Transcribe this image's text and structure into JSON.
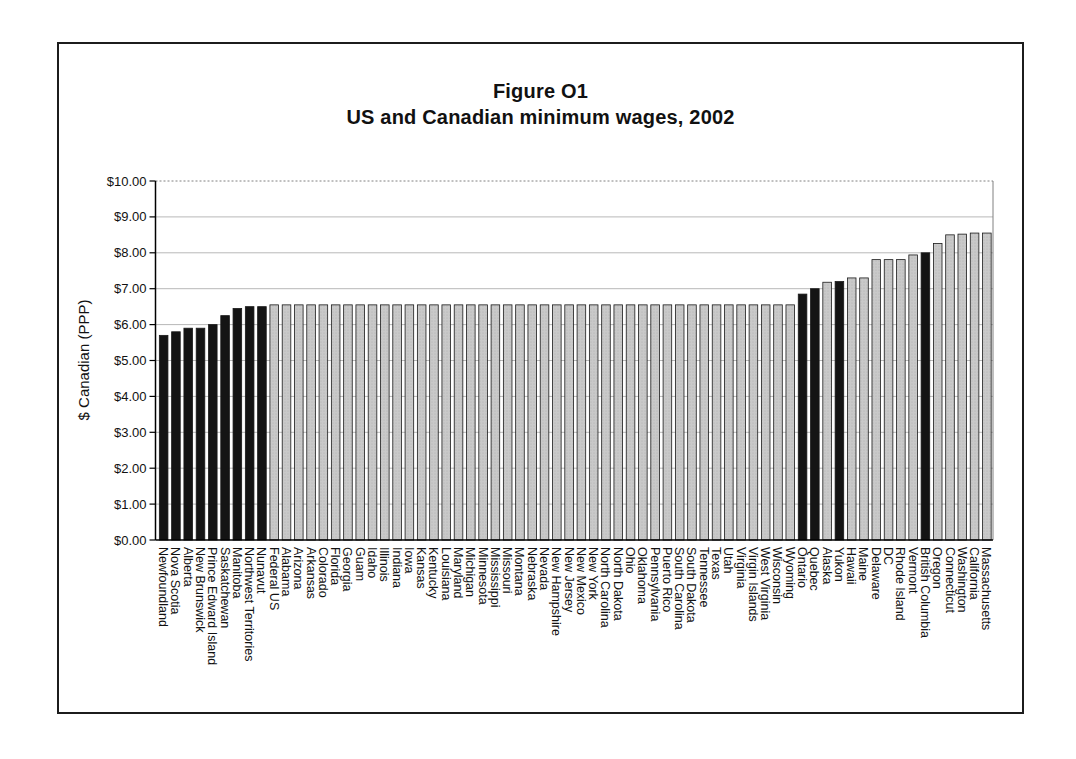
{
  "figure": {
    "title_line1": "Figure O1",
    "title_line2": "US and Canadian minimum wages, 2002"
  },
  "chart_data": {
    "type": "bar",
    "title": "Figure O1",
    "subtitle": "US and Canadian minimum wages, 2002",
    "xlabel": "",
    "ylabel": "$ Canadian (PPP)",
    "ylim": [
      0,
      10
    ],
    "ytick_labels": [
      "$0.00",
      "$1.00",
      "$2.00",
      "$3.00",
      "$4.00",
      "$5.00",
      "$6.00",
      "$7.00",
      "$8.00",
      "$9.00",
      "$10.00"
    ],
    "grid": "horizontal",
    "legend": "none",
    "colors": {
      "canada": "#141414",
      "us": "#c9c9c9",
      "bar_stroke": "#1a1a1a",
      "gridline": "#b8b8b8",
      "plot_border": "#808080",
      "axis": "#000000",
      "text": "#111111"
    },
    "bars": [
      {
        "label": "Newfoundland",
        "value": 5.7,
        "group": "canada"
      },
      {
        "label": "Nova Scotia",
        "value": 5.8,
        "group": "canada"
      },
      {
        "label": "Alberta",
        "value": 5.9,
        "group": "canada"
      },
      {
        "label": "New Brunswick",
        "value": 5.9,
        "group": "canada"
      },
      {
        "label": "Prince Edward Island",
        "value": 6.0,
        "group": "canada"
      },
      {
        "label": "Saskatchewan",
        "value": 6.25,
        "group": "canada"
      },
      {
        "label": "Manitoba",
        "value": 6.45,
        "group": "canada"
      },
      {
        "label": "Northwest Territories",
        "value": 6.5,
        "group": "canada"
      },
      {
        "label": "Nunavut",
        "value": 6.5,
        "group": "canada"
      },
      {
        "label": "Federal US",
        "value": 6.55,
        "group": "us"
      },
      {
        "label": "Alabama",
        "value": 6.55,
        "group": "us"
      },
      {
        "label": "Arizona",
        "value": 6.55,
        "group": "us"
      },
      {
        "label": "Arkansas",
        "value": 6.55,
        "group": "us"
      },
      {
        "label": "Colorado",
        "value": 6.55,
        "group": "us"
      },
      {
        "label": "Florida",
        "value": 6.55,
        "group": "us"
      },
      {
        "label": "Georgia",
        "value": 6.55,
        "group": "us"
      },
      {
        "label": "Guam",
        "value": 6.55,
        "group": "us"
      },
      {
        "label": "Idaho",
        "value": 6.55,
        "group": "us"
      },
      {
        "label": "Illinois",
        "value": 6.55,
        "group": "us"
      },
      {
        "label": "Indiana",
        "value": 6.55,
        "group": "us"
      },
      {
        "label": "Iowa",
        "value": 6.55,
        "group": "us"
      },
      {
        "label": "Kansas",
        "value": 6.55,
        "group": "us"
      },
      {
        "label": "Kentucky",
        "value": 6.55,
        "group": "us"
      },
      {
        "label": "Louisiana",
        "value": 6.55,
        "group": "us"
      },
      {
        "label": "Maryland",
        "value": 6.55,
        "group": "us"
      },
      {
        "label": "Michigan",
        "value": 6.55,
        "group": "us"
      },
      {
        "label": "Minnesota",
        "value": 6.55,
        "group": "us"
      },
      {
        "label": "Mississippi",
        "value": 6.55,
        "group": "us"
      },
      {
        "label": "Missouri",
        "value": 6.55,
        "group": "us"
      },
      {
        "label": "Montana",
        "value": 6.55,
        "group": "us"
      },
      {
        "label": "Nebraska",
        "value": 6.55,
        "group": "us"
      },
      {
        "label": "Nevada",
        "value": 6.55,
        "group": "us"
      },
      {
        "label": "New Hampshire",
        "value": 6.55,
        "group": "us"
      },
      {
        "label": "New Jersey",
        "value": 6.55,
        "group": "us"
      },
      {
        "label": "New Mexico",
        "value": 6.55,
        "group": "us"
      },
      {
        "label": "New York",
        "value": 6.55,
        "group": "us"
      },
      {
        "label": "North Carolina",
        "value": 6.55,
        "group": "us"
      },
      {
        "label": "North Dakota",
        "value": 6.55,
        "group": "us"
      },
      {
        "label": "Ohio",
        "value": 6.55,
        "group": "us"
      },
      {
        "label": "Oklahoma",
        "value": 6.55,
        "group": "us"
      },
      {
        "label": "Pennsylvania",
        "value": 6.55,
        "group": "us"
      },
      {
        "label": "Puerto Rico",
        "value": 6.55,
        "group": "us"
      },
      {
        "label": "South Carolina",
        "value": 6.55,
        "group": "us"
      },
      {
        "label": "South Dakota",
        "value": 6.55,
        "group": "us"
      },
      {
        "label": "Tennessee",
        "value": 6.55,
        "group": "us"
      },
      {
        "label": "Texas",
        "value": 6.55,
        "group": "us"
      },
      {
        "label": "Utah",
        "value": 6.55,
        "group": "us"
      },
      {
        "label": "Virginia",
        "value": 6.55,
        "group": "us"
      },
      {
        "label": "Virgin Islands",
        "value": 6.55,
        "group": "us"
      },
      {
        "label": "West Virginia",
        "value": 6.55,
        "group": "us"
      },
      {
        "label": "Wisconsin",
        "value": 6.55,
        "group": "us"
      },
      {
        "label": "Wyoming",
        "value": 6.55,
        "group": "us"
      },
      {
        "label": "Ontario",
        "value": 6.85,
        "group": "canada"
      },
      {
        "label": "Quebec",
        "value": 7.0,
        "group": "canada"
      },
      {
        "label": "Alaska",
        "value": 7.18,
        "group": "us"
      },
      {
        "label": "Yukon",
        "value": 7.2,
        "group": "canada"
      },
      {
        "label": "Hawaii",
        "value": 7.3,
        "group": "us"
      },
      {
        "label": "Maine",
        "value": 7.3,
        "group": "us"
      },
      {
        "label": "Delaware",
        "value": 7.81,
        "group": "us"
      },
      {
        "label": "DC",
        "value": 7.81,
        "group": "us"
      },
      {
        "label": "Rhode Island",
        "value": 7.81,
        "group": "us"
      },
      {
        "label": "Vermont",
        "value": 7.94,
        "group": "us"
      },
      {
        "label": "British Columbia",
        "value": 8.0,
        "group": "canada"
      },
      {
        "label": "Oregon",
        "value": 8.26,
        "group": "us"
      },
      {
        "label": "Connecticut",
        "value": 8.5,
        "group": "us"
      },
      {
        "label": "Washington",
        "value": 8.52,
        "group": "us"
      },
      {
        "label": "California",
        "value": 8.55,
        "group": "us"
      },
      {
        "label": "Massachusetts",
        "value": 8.55,
        "group": "us"
      }
    ]
  }
}
